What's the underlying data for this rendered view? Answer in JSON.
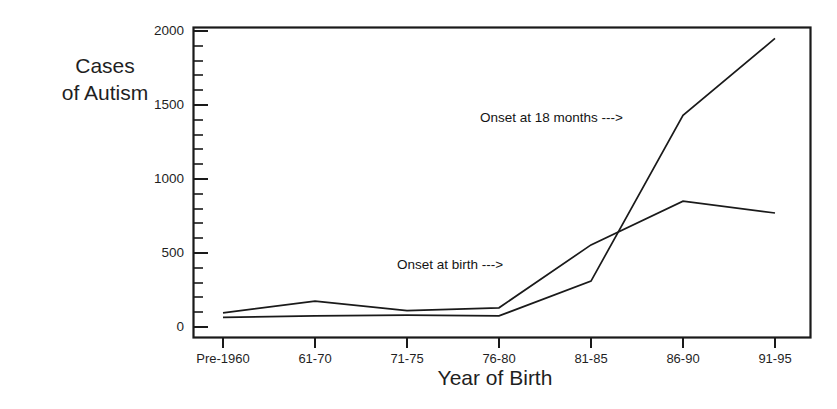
{
  "chart_data": {
    "type": "line",
    "title": "",
    "xlabel": "Year of Birth",
    "ylabel": "Cases\nof Autism",
    "categories": [
      "Pre-1960",
      "61-70",
      "71-75",
      "76-80",
      "81-85",
      "86-90",
      "91-95"
    ],
    "ylim": [
      0,
      2000
    ],
    "yticks": [
      0,
      500,
      1000,
      1500,
      2000
    ],
    "ytick_labels": [
      "0",
      "500",
      "1000",
      "1500",
      "2000"
    ],
    "yminor_tick_step": 100,
    "grid": false,
    "legend_position": "inline-annotations",
    "series": [
      {
        "name": "Onset at birth",
        "values": [
          95,
          175,
          110,
          130,
          555,
          850,
          770
        ],
        "annotation": "Onset at birth --->",
        "color": "#1a1a1a"
      },
      {
        "name": "Onset at 18 months",
        "values": [
          65,
          75,
          80,
          75,
          310,
          1430,
          1950
        ],
        "annotation": "Onset at 18 months --->",
        "color": "#1a1a1a"
      }
    ],
    "annotations": [
      {
        "text": "Onset at 18 months --->",
        "x_px": 480,
        "y_px": 118
      },
      {
        "text": "Onset at birth --->",
        "x_px": 397,
        "y_px": 265
      }
    ]
  },
  "axis": {
    "y_title": "Cases\nof Autism",
    "x_title": "Year of Birth",
    "y_labels": [
      "2000",
      "1500",
      "1000",
      "500",
      "0"
    ],
    "x_labels": [
      "Pre-1960",
      "61-70",
      "71-75",
      "76-80",
      "81-85",
      "86-90",
      "91-95"
    ]
  },
  "colors": {
    "line": "#1a1a1a",
    "axis": "#1a1a1a",
    "background": "#ffffff",
    "text": "#1f1f1f"
  }
}
